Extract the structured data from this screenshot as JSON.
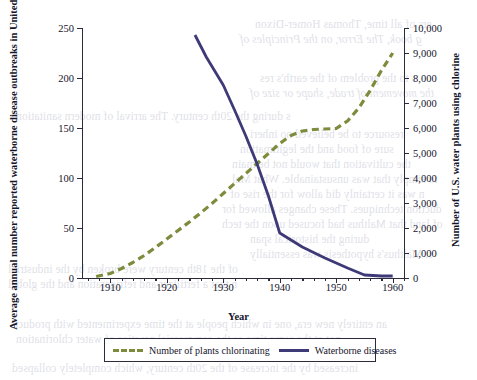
{
  "chart_data": {
    "type": "line",
    "title": "",
    "xlabel": "Year",
    "ylabel_left": "Average annual number reported waterborne disease outbreaks in United States",
    "ylabel_right": "Number of U.S. water plants using chlorine",
    "xlim": [
      1905,
      1962
    ],
    "xticks": [
      1910,
      1920,
      1930,
      1940,
      1950,
      1960
    ],
    "xtick_labels": [
      "1910",
      "1920",
      "1930",
      "1940",
      "1950",
      "1960"
    ],
    "xminor_step": 2,
    "ylim_left": [
      0,
      250
    ],
    "yticks_left": [
      0,
      50,
      100,
      150,
      200,
      250
    ],
    "ytick_labels_left": [
      "0",
      "50",
      "100",
      "150",
      "200",
      "250"
    ],
    "ylim_right": [
      0,
      10000
    ],
    "yticks_right": [
      0,
      1000,
      2000,
      3000,
      4000,
      5000,
      6000,
      7000,
      8000,
      9000,
      10000
    ],
    "ytick_labels_right": [
      "0",
      "1,000",
      "2,000",
      "3,000",
      "4,000",
      "5,000",
      "6,000",
      "7,000",
      "8,000",
      "9,000",
      "10,000"
    ],
    "grid": false,
    "legend_position": "below-axes",
    "series": [
      {
        "name": "Number of plants chlorinating",
        "axis": "right",
        "color": "#7d8c3c",
        "style": "dashed",
        "x": [
          1907.5,
          1910,
          1912,
          1914,
          1916,
          1918,
          1920,
          1922,
          1924,
          1926,
          1928,
          1930,
          1932,
          1934,
          1936,
          1938,
          1940,
          1942,
          1944,
          1946,
          1948,
          1950,
          1952,
          1954,
          1956,
          1958,
          1960
        ],
        "values": [
          60,
          180,
          380,
          620,
          900,
          1220,
          1560,
          1900,
          2240,
          2600,
          2980,
          3380,
          3780,
          4180,
          4580,
          4980,
          5380,
          5700,
          5880,
          5940,
          5960,
          5980,
          6280,
          6800,
          7500,
          8300,
          9000
        ]
      },
      {
        "name": "Waterborne diseases",
        "axis": "left",
        "color": "#3e3a77",
        "style": "solid",
        "x": [
          1925,
          1927,
          1930,
          1932,
          1934,
          1936,
          1938,
          1940,
          1944,
          1948,
          1952,
          1955,
          1958,
          1960
        ],
        "values": [
          243,
          221,
          193,
          168,
          142,
          114,
          82,
          45,
          31,
          20,
          10,
          3,
          2,
          2
        ]
      }
    ]
  },
  "legend": {
    "items": [
      {
        "label": "Number of plants chlorinating",
        "swatch": "dashed-olive"
      },
      {
        "label": "Waterborne diseases",
        "swatch": "solid-purple"
      }
    ]
  },
  "ghost_text": {
    "lines": [
      "ers of all time, Thomas Homer-Dixon",
      "g book, The Error, on the Principles of",
      "s to the problem of the earth's res",
      "the movement of trade, shape or size of",
      "resource to be believed no inheri",
      "sure of food and the legitimation",
      "the cultivation that would not be main",
      "to simply that was unsustainable. What Mal",
      "n was it certainly did allow for the rise of",
      "duction techniques. These changes allowed for",
      "of land that Malthus had focused upon the tech",
      "during the historical span",
      "s. Malthus's hypothesis was essentially",
      "Malthus's hypothesis was essentially correct,",
      "of the 18th century were broken by the industrial",
      "n that a fertilizer and refrigeration and the global",
      "an entirely new era, one in which people at the time experimented with products",
      "not at the same time as the commercial practice of water chlorination",
      "increased by the increase of the 20th century, which completely collapsed",
      "s during the 20th century. The arrival of modern sanitation"
    ]
  }
}
